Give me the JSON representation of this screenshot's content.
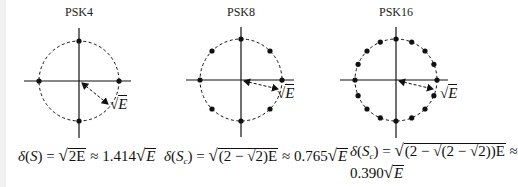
{
  "diagrams": [
    {
      "id": "psk4",
      "title": "PSK4",
      "points": 4,
      "center": [
        79,
        81
      ],
      "radius": 40,
      "arrow_label": "√E",
      "formula_lhs": "δ(S) = ",
      "formula_rad": "2E",
      "formula_rhs": " ≈ 1.414",
      "formula_tail": "E",
      "distance_coefficient": "1.414"
    },
    {
      "id": "psk8",
      "title": "PSK8",
      "points": 8,
      "center": [
        241,
        80
      ],
      "radius": 41,
      "arrow_label": "√E",
      "formula_lhs": "δ(S",
      "formula_sub": "c",
      "formula_mid": ") = ",
      "formula_rad": "(2 − √2)E",
      "formula_rhs": " ≈ 0.765",
      "formula_tail": "E",
      "distance_coefficient": "0.765"
    },
    {
      "id": "psk16",
      "title": "PSK16",
      "points": 16,
      "center": [
        396,
        80
      ],
      "radius": 41,
      "arrow_label": "√E",
      "formula_lhs": "δ(S",
      "formula_sub": "c",
      "formula_mid": ") = ",
      "formula_rad": "(2 − √(2 − √2))E",
      "formula_rhs": " ≈",
      "formula_line2": "0.390",
      "formula_tail": "E",
      "distance_coefficient": "0.390"
    }
  ],
  "colors": {
    "stroke": "#111111",
    "background": "#ffffff"
  }
}
